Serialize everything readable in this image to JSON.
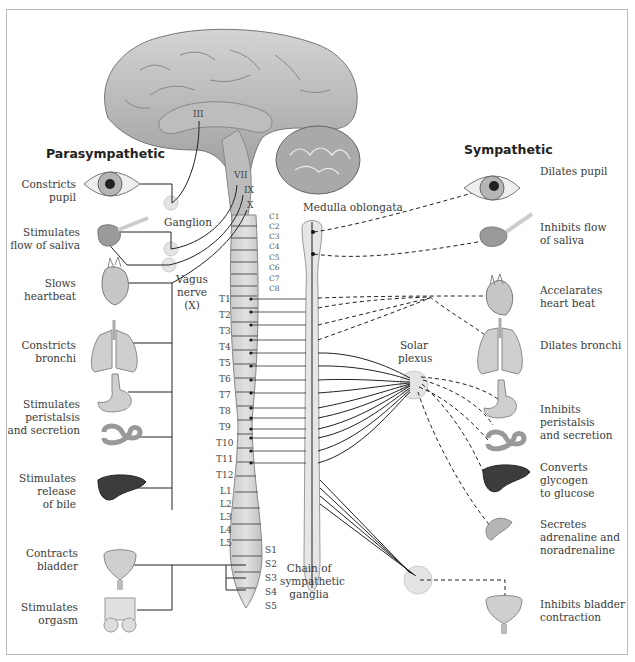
{
  "headings": {
    "parasympathetic": "Parasympathetic",
    "sympathetic": "Sympathetic"
  },
  "structures": {
    "ganglion": "Ganglion",
    "vagus": [
      "Vagus",
      "nerve",
      "(X)"
    ],
    "medulla": "Medulla oblongata",
    "solar_plexus": [
      "Solar",
      "plexus"
    ],
    "chain": [
      "Chain of",
      "sympathetic",
      "ganglia"
    ]
  },
  "cranial_nerves": [
    "III",
    "VII",
    "IX",
    "X"
  ],
  "spinal_segments": {
    "cervical": [
      "C1",
      "C2",
      "C3",
      "C4",
      "C5",
      "C6",
      "C7",
      "C8"
    ],
    "thoracic": [
      "T1",
      "T2",
      "T3",
      "T4",
      "T5",
      "T6",
      "T7",
      "T8",
      "T9",
      "T10",
      "T11",
      "T12"
    ],
    "lumbar": [
      "L1",
      "L2",
      "L3",
      "L4",
      "L5"
    ],
    "sacral": [
      "S1",
      "S2",
      "S3",
      "S4",
      "S5"
    ]
  },
  "parasympathetic_effects": [
    {
      "organ": "eye",
      "lines": [
        "Constricts",
        "pupil"
      ]
    },
    {
      "organ": "salivary-gland",
      "lines": [
        "Stimulates",
        "flow of saliva"
      ]
    },
    {
      "organ": "heart",
      "lines": [
        "Slows",
        "heartbeat"
      ]
    },
    {
      "organ": "lungs",
      "lines": [
        "Constricts",
        "bronchi"
      ]
    },
    {
      "organ": "stomach-intestine",
      "lines": [
        "Stimulates",
        "peristalsis",
        "and secretion"
      ]
    },
    {
      "organ": "liver",
      "lines": [
        "Stimulates",
        "release",
        "of bile"
      ]
    },
    {
      "organ": "bladder",
      "lines": [
        "Contracts",
        "bladder"
      ]
    },
    {
      "organ": "genitals",
      "lines": [
        "Stimulates",
        "orgasm"
      ]
    }
  ],
  "sympathetic_effects": [
    {
      "organ": "eye",
      "lines": [
        "Dilates pupil"
      ]
    },
    {
      "organ": "salivary-gland",
      "lines": [
        "Inhibits flow",
        "of saliva"
      ]
    },
    {
      "organ": "heart",
      "lines": [
        "Accelarates",
        "heart beat"
      ]
    },
    {
      "organ": "lungs",
      "lines": [
        "Dilates bronchi"
      ]
    },
    {
      "organ": "stomach-intestine",
      "lines": [
        "Inhibits peristalsis",
        "and secretion"
      ]
    },
    {
      "organ": "liver",
      "lines": [
        "Converts",
        "glycogen",
        "to glucose"
      ]
    },
    {
      "organ": "adrenal",
      "lines": [
        "Secretes",
        "adrenaline and",
        "noradrenaline"
      ]
    },
    {
      "organ": "bladder",
      "lines": [
        "Inhibits bladder",
        "contraction"
      ]
    }
  ],
  "colors": {
    "frame": "#bbbbbb",
    "organ_fill": "#d9d9d9",
    "organ_stroke": "#8a8a8a",
    "liver": "#3c3c3c",
    "ganglion": "#e4e4e4",
    "line": "#222222"
  }
}
